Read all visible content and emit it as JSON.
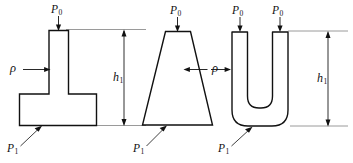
{
  "figure": {
    "domain": "diagram",
    "width": 353,
    "height": 163,
    "background_color": "#ffffff",
    "line_color": "#111111",
    "extension_line_color": "#8f8f8f"
  },
  "symbols": {
    "pressure_top": "P",
    "pressure_top_sub": "0",
    "pressure_bottom": "P",
    "pressure_bottom_sub": "1",
    "density": "ρ",
    "height": "h",
    "height_sub": "1"
  },
  "panels": [
    {
      "id": "panel-t-shape",
      "name": "t-shaped-vessel",
      "shape": "inverted-T",
      "labels": {
        "top_pressure": "P",
        "top_pressure_sub": "0",
        "bottom_pressure": "P",
        "bottom_pressure_sub": "1",
        "density": "ρ"
      }
    },
    {
      "id": "panel-trapezoid",
      "name": "trapezoidal-vessel",
      "shape": "trapezoid",
      "labels": {
        "top_pressure": "P",
        "top_pressure_sub": "0",
        "bottom_pressure": "P",
        "bottom_pressure_sub": "1",
        "density": "ρ"
      }
    },
    {
      "id": "panel-u-tube",
      "name": "u-tube-vessel",
      "shape": "U-tube",
      "labels": {
        "top_pressure_left": "P",
        "top_pressure_left_sub": "0",
        "top_pressure_right": "P",
        "top_pressure_right_sub": "0",
        "bottom_pressure": "P",
        "bottom_pressure_sub": "1"
      }
    }
  ],
  "dimensions": [
    {
      "id": "dim-h1-left",
      "name": "height-dimension-left",
      "label": "h",
      "label_sub": "1",
      "style": "double-headed-vertical-arrow"
    },
    {
      "id": "dim-h1-right",
      "name": "height-dimension-right",
      "label": "h",
      "label_sub": "1",
      "style": "double-headed-vertical-arrow"
    }
  ]
}
